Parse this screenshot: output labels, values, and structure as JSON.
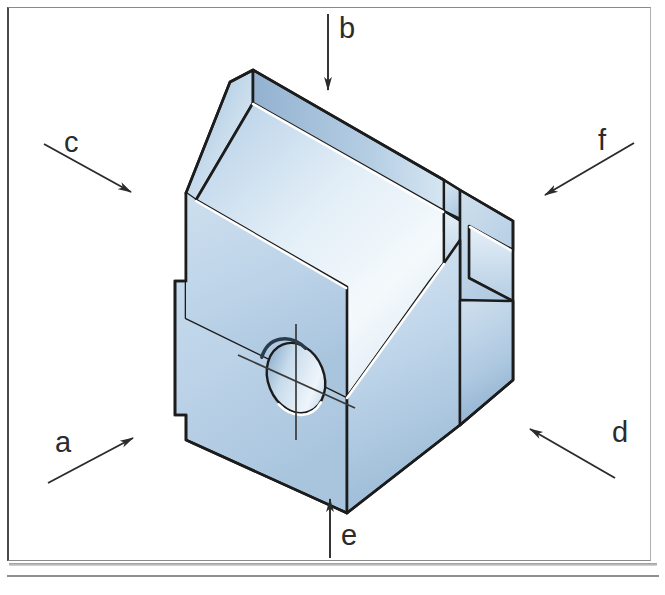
{
  "figure": {
    "type": "isometric-technical-drawing",
    "frame": {
      "border_color": "#4a4a4a",
      "background": "#ffffff"
    },
    "solid": {
      "fill_light": "#eef4fa",
      "fill_mid": "#bcd3e8",
      "fill_dark": "#9fbdd8",
      "outline_color": "#1c1c1c",
      "highlight_color": "#ffffff"
    },
    "arrows": [
      {
        "id": "a",
        "label": "a",
        "direction": "up-right",
        "tail": [
          48,
          483
        ],
        "head": [
          135,
          437
        ]
      },
      {
        "id": "b",
        "label": "b",
        "direction": "down",
        "tail": [
          328,
          14
        ],
        "head": [
          328,
          92
        ]
      },
      {
        "id": "c",
        "label": "c",
        "direction": "down-right",
        "tail": [
          44,
          144
        ],
        "head": [
          133,
          193
        ]
      },
      {
        "id": "d",
        "label": "d",
        "direction": "up-left",
        "tail": [
          615,
          478
        ],
        "head": [
          528,
          428
        ]
      },
      {
        "id": "e",
        "label": "e",
        "direction": "up",
        "tail": [
          330,
          558
        ],
        "head": [
          330,
          497
        ]
      },
      {
        "id": "f",
        "label": "f",
        "direction": "down-left",
        "tail": [
          634,
          143
        ],
        "head": [
          543,
          196
        ]
      }
    ],
    "arrow_color": "#2b2b2b",
    "label_color": "#2b2b2b",
    "hole": {
      "shape": "ellipse",
      "center": [
        296,
        378
      ],
      "rx": 28,
      "ry": 36,
      "has_centerlines": true
    }
  }
}
